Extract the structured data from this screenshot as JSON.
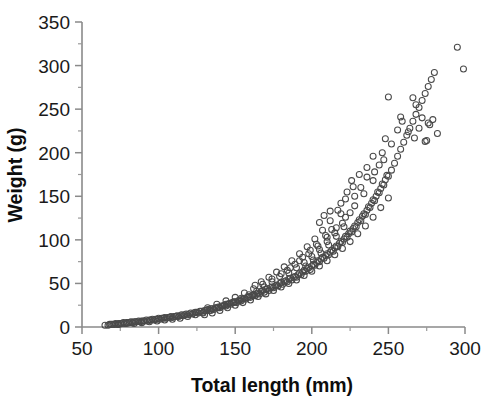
{
  "chart_data": {
    "type": "scatter",
    "title": "",
    "xlabel": "Total length (mm)",
    "ylabel": "Weight (g)",
    "xlim": [
      50,
      300
    ],
    "ylim": [
      0,
      350
    ],
    "x_major_ticks": [
      50,
      100,
      150,
      200,
      250,
      300
    ],
    "y_major_ticks": [
      0,
      50,
      100,
      150,
      200,
      250,
      300,
      350
    ],
    "x_minor_tick_interval": 25,
    "y_minor_tick_interval": 25,
    "x_tick_labels": [
      "50",
      "100",
      "150",
      "200",
      "250",
      "300"
    ],
    "y_tick_labels": [
      "0",
      "50",
      "100",
      "150",
      "200",
      "250",
      "300",
      "350"
    ],
    "grid": false,
    "legend": "none",
    "marker": "open-circle",
    "marker_color": "#4a4a4a",
    "marker_size_px": 6,
    "n_points": 296,
    "relationship": "power-law allometric growth, weight increases steeply with length",
    "points": [
      [
        65,
        2
      ],
      [
        67,
        2
      ],
      [
        68,
        3
      ],
      [
        70,
        3
      ],
      [
        71,
        3
      ],
      [
        72,
        4
      ],
      [
        73,
        3
      ],
      [
        74,
        4
      ],
      [
        75,
        4
      ],
      [
        76,
        4
      ],
      [
        77,
        5
      ],
      [
        78,
        4
      ],
      [
        79,
        5
      ],
      [
        80,
        5
      ],
      [
        81,
        5
      ],
      [
        82,
        6
      ],
      [
        83,
        5
      ],
      [
        84,
        6
      ],
      [
        85,
        6
      ],
      [
        86,
        6
      ],
      [
        87,
        7
      ],
      [
        88,
        6
      ],
      [
        89,
        7
      ],
      [
        90,
        7
      ],
      [
        91,
        7
      ],
      [
        92,
        8
      ],
      [
        93,
        7
      ],
      [
        94,
        8
      ],
      [
        95,
        8
      ],
      [
        96,
        9
      ],
      [
        97,
        8
      ],
      [
        98,
        9
      ],
      [
        99,
        9
      ],
      [
        100,
        10
      ],
      [
        101,
        9
      ],
      [
        102,
        10
      ],
      [
        103,
        10
      ],
      [
        104,
        11
      ],
      [
        105,
        10
      ],
      [
        106,
        11
      ],
      [
        107,
        11
      ],
      [
        108,
        12
      ],
      [
        109,
        11
      ],
      [
        110,
        12
      ],
      [
        111,
        12
      ],
      [
        112,
        13
      ],
      [
        113,
        12
      ],
      [
        114,
        13
      ],
      [
        115,
        14
      ],
      [
        116,
        13
      ],
      [
        117,
        14
      ],
      [
        118,
        15
      ],
      [
        119,
        14
      ],
      [
        120,
        15
      ],
      [
        121,
        16
      ],
      [
        122,
        15
      ],
      [
        123,
        16
      ],
      [
        124,
        17
      ],
      [
        125,
        17
      ],
      [
        126,
        16
      ],
      [
        127,
        18
      ],
      [
        128,
        18
      ],
      [
        129,
        17
      ],
      [
        130,
        19
      ],
      [
        131,
        19
      ],
      [
        132,
        20
      ],
      [
        133,
        19
      ],
      [
        134,
        21
      ],
      [
        135,
        21
      ],
      [
        136,
        20
      ],
      [
        137,
        22
      ],
      [
        138,
        22
      ],
      [
        139,
        23
      ],
      [
        140,
        22
      ],
      [
        141,
        24
      ],
      [
        142,
        24
      ],
      [
        143,
        25
      ],
      [
        144,
        24
      ],
      [
        145,
        26
      ],
      [
        146,
        27
      ],
      [
        147,
        26
      ],
      [
        148,
        28
      ],
      [
        149,
        28
      ],
      [
        150,
        29
      ],
      [
        151,
        28
      ],
      [
        152,
        30
      ],
      [
        153,
        31
      ],
      [
        154,
        30
      ],
      [
        155,
        32
      ],
      [
        156,
        33
      ],
      [
        157,
        32
      ],
      [
        158,
        34
      ],
      [
        159,
        35
      ],
      [
        160,
        34
      ],
      [
        161,
        36
      ],
      [
        162,
        37
      ],
      [
        163,
        36
      ],
      [
        164,
        38
      ],
      [
        165,
        39
      ],
      [
        166,
        38
      ],
      [
        167,
        41
      ],
      [
        168,
        42
      ],
      [
        169,
        40
      ],
      [
        170,
        43
      ],
      [
        171,
        44
      ],
      [
        172,
        42
      ],
      [
        173,
        45
      ],
      [
        174,
        46
      ],
      [
        175,
        45
      ],
      [
        176,
        47
      ],
      [
        177,
        48
      ],
      [
        178,
        47
      ],
      [
        179,
        50
      ],
      [
        180,
        51
      ],
      [
        181,
        49
      ],
      [
        182,
        52
      ],
      [
        183,
        53
      ],
      [
        184,
        52
      ],
      [
        185,
        55
      ],
      [
        186,
        56
      ],
      [
        187,
        54
      ],
      [
        188,
        57
      ],
      [
        189,
        58
      ],
      [
        190,
        57
      ],
      [
        191,
        60
      ],
      [
        192,
        62
      ],
      [
        193,
        60
      ],
      [
        194,
        63
      ],
      [
        195,
        65
      ],
      [
        196,
        64
      ],
      [
        197,
        67
      ],
      [
        198,
        68
      ],
      [
        199,
        66
      ],
      [
        200,
        70
      ],
      [
        201,
        72
      ],
      [
        202,
        71
      ],
      [
        203,
        74
      ],
      [
        204,
        76
      ],
      [
        205,
        75
      ],
      [
        206,
        78
      ],
      [
        207,
        80
      ],
      [
        208,
        79
      ],
      [
        209,
        82
      ],
      [
        210,
        84
      ],
      [
        211,
        83
      ],
      [
        212,
        86
      ],
      [
        213,
        88
      ],
      [
        214,
        87
      ],
      [
        215,
        91
      ],
      [
        216,
        93
      ],
      [
        217,
        92
      ],
      [
        218,
        96
      ],
      [
        219,
        98
      ],
      [
        220,
        97
      ],
      [
        221,
        101
      ],
      [
        222,
        104
      ],
      [
        223,
        103
      ],
      [
        224,
        107
      ],
      [
        225,
        110
      ],
      [
        226,
        109
      ],
      [
        227,
        113
      ],
      [
        228,
        116
      ],
      [
        229,
        115
      ],
      [
        230,
        120
      ],
      [
        231,
        123
      ],
      [
        232,
        122
      ],
      [
        233,
        127
      ],
      [
        234,
        130
      ],
      [
        235,
        129
      ],
      [
        236,
        134
      ],
      [
        237,
        138
      ],
      [
        238,
        137
      ],
      [
        239,
        142
      ],
      [
        240,
        146
      ],
      [
        241,
        145
      ],
      [
        242,
        150
      ],
      [
        243,
        155
      ],
      [
        244,
        154
      ],
      [
        245,
        159
      ],
      [
        246,
        164
      ],
      [
        247,
        163
      ],
      [
        248,
        169
      ],
      [
        249,
        174
      ],
      [
        250,
        173
      ],
      [
        252,
        180
      ],
      [
        254,
        188
      ],
      [
        256,
        196
      ],
      [
        258,
        204
      ],
      [
        260,
        212
      ],
      [
        262,
        220
      ],
      [
        264,
        228
      ],
      [
        266,
        236
      ],
      [
        268,
        244
      ],
      [
        270,
        252
      ],
      [
        272,
        260
      ],
      [
        274,
        268
      ],
      [
        276,
        276
      ],
      [
        278,
        284
      ],
      [
        280,
        292
      ],
      [
        130,
        14
      ],
      [
        135,
        16
      ],
      [
        140,
        19
      ],
      [
        145,
        22
      ],
      [
        150,
        25
      ],
      [
        155,
        28
      ],
      [
        160,
        31
      ],
      [
        165,
        35
      ],
      [
        170,
        38
      ],
      [
        175,
        42
      ],
      [
        180,
        46
      ],
      [
        185,
        50
      ],
      [
        190,
        54
      ],
      [
        195,
        59
      ],
      [
        200,
        64
      ],
      [
        205,
        70
      ],
      [
        210,
        76
      ],
      [
        215,
        83
      ],
      [
        220,
        90
      ],
      [
        225,
        98
      ],
      [
        230,
        107
      ],
      [
        235,
        116
      ],
      [
        240,
        126
      ],
      [
        245,
        137
      ],
      [
        250,
        148
      ],
      [
        132,
        22
      ],
      [
        138,
        26
      ],
      [
        144,
        30
      ],
      [
        150,
        34
      ],
      [
        156,
        39
      ],
      [
        162,
        44
      ],
      [
        168,
        49
      ],
      [
        174,
        55
      ],
      [
        180,
        61
      ],
      [
        186,
        68
      ],
      [
        192,
        76
      ],
      [
        198,
        84
      ],
      [
        204,
        93
      ],
      [
        210,
        103
      ],
      [
        216,
        114
      ],
      [
        222,
        126
      ],
      [
        228,
        139
      ],
      [
        234,
        153
      ],
      [
        240,
        168
      ],
      [
        163,
        48
      ],
      [
        167,
        52
      ],
      [
        172,
        57
      ],
      [
        177,
        63
      ],
      [
        182,
        69
      ],
      [
        187,
        76
      ],
      [
        192,
        84
      ],
      [
        197,
        92
      ],
      [
        202,
        101
      ],
      [
        207,
        111
      ],
      [
        212,
        122
      ],
      [
        217,
        134
      ],
      [
        222,
        147
      ],
      [
        227,
        161
      ],
      [
        185,
        62
      ],
      [
        190,
        68
      ],
      [
        195,
        74
      ],
      [
        200,
        81
      ],
      [
        205,
        89
      ],
      [
        210,
        98
      ],
      [
        215,
        108
      ],
      [
        220,
        119
      ],
      [
        225,
        131
      ],
      [
        196,
        70
      ],
      [
        201,
        77
      ],
      [
        206,
        85
      ],
      [
        211,
        94
      ],
      [
        216,
        104
      ],
      [
        221,
        115
      ],
      [
        205,
        120
      ],
      [
        208,
        128
      ],
      [
        212,
        133
      ],
      [
        219,
        142
      ],
      [
        223,
        155
      ],
      [
        226,
        168
      ],
      [
        231,
        175
      ],
      [
        236,
        183
      ],
      [
        240,
        196
      ],
      [
        246,
        200
      ],
      [
        252,
        210
      ],
      [
        256,
        226
      ],
      [
        259,
        236
      ],
      [
        263,
        224
      ],
      [
        266,
        263
      ],
      [
        267,
        217
      ],
      [
        268,
        255
      ],
      [
        270,
        228
      ],
      [
        272,
        240
      ],
      [
        274,
        213
      ],
      [
        275,
        214
      ],
      [
        276,
        234
      ],
      [
        277,
        232
      ],
      [
        279,
        238
      ],
      [
        282,
        222
      ],
      [
        248,
        216
      ],
      [
        250,
        264
      ],
      [
        258,
        241
      ],
      [
        295,
        321
      ],
      [
        299,
        296
      ],
      [
        228,
        150
      ],
      [
        232,
        160
      ],
      [
        236,
        172
      ],
      [
        244,
        186
      ],
      [
        241,
        178
      ],
      [
        247,
        192
      ],
      [
        219,
        130
      ],
      [
        213,
        112
      ],
      [
        209,
        105
      ],
      [
        203,
        95
      ],
      [
        199,
        88
      ],
      [
        194,
        80
      ],
      [
        189,
        72
      ],
      [
        184,
        65
      ],
      [
        179,
        58
      ],
      [
        174,
        52
      ],
      [
        169,
        46
      ],
      [
        164,
        41
      ],
      [
        159,
        37
      ],
      [
        154,
        33
      ],
      [
        149,
        29
      ],
      [
        144,
        26
      ],
      [
        139,
        22
      ],
      [
        134,
        19
      ],
      [
        129,
        16
      ],
      [
        124,
        14
      ],
      [
        119,
        12
      ],
      [
        114,
        10
      ],
      [
        109,
        9
      ],
      [
        104,
        8
      ],
      [
        99,
        7
      ],
      [
        94,
        6
      ],
      [
        89,
        5
      ],
      [
        84,
        4
      ],
      [
        79,
        4
      ],
      [
        74,
        3
      ],
      [
        69,
        3
      ]
    ]
  },
  "axes": {
    "x_axis_name": "x-axis",
    "y_axis_name": "y-axis"
  }
}
